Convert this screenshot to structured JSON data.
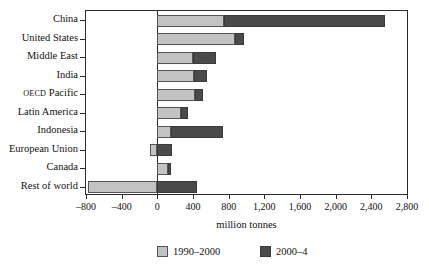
{
  "chart_data": {
    "type": "bar",
    "orientation": "horizontal",
    "stacked": true,
    "title": "",
    "xlabel": "million tonnes",
    "ylabel": "",
    "xlim": [
      -800,
      2800
    ],
    "xticks": [
      -800,
      -400,
      0,
      400,
      800,
      1200,
      1600,
      2000,
      2400,
      2800
    ],
    "xtick_labels": [
      "-800",
      "-400",
      "0",
      "400",
      "800",
      "1,200",
      "1,600",
      "2,000",
      "2,400",
      "2,800"
    ],
    "grid": false,
    "legend_position": "bottom",
    "categories": [
      "China",
      "United States",
      "Middle East",
      "India",
      "OECD Pacific",
      "Latin America",
      "Indonesia",
      "European Union",
      "Canada",
      "Rest of world"
    ],
    "series": [
      {
        "name": "1990–2000",
        "color": "#c3c3c3",
        "values": [
          750,
          870,
          400,
          410,
          420,
          265,
          150,
          -80,
          120,
          -780
        ]
      },
      {
        "name": "2000–4",
        "color": "#4a4a4a",
        "values": [
          1800,
          105,
          260,
          150,
          90,
          80,
          590,
          170,
          35,
          450
        ]
      }
    ],
    "totals": [
      2550,
      975,
      660,
      560,
      510,
      345,
      740,
      90,
      155,
      -330
    ]
  },
  "legend": {
    "items": [
      {
        "label": "1990–2000",
        "swatch": "s1"
      },
      {
        "label": "2000–4",
        "swatch": "s2"
      }
    ]
  },
  "axis": {
    "x_title": "million tonnes"
  }
}
